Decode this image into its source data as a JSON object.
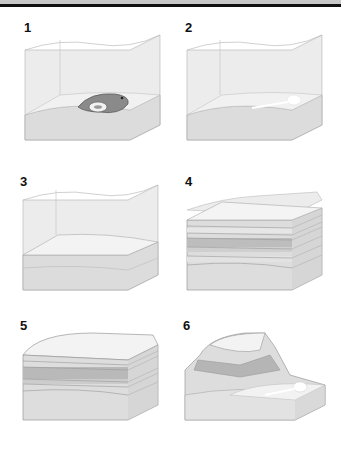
{
  "panels": [
    {
      "number": "1",
      "description": "Dead fish lies on sediment at the bottom of water"
    },
    {
      "number": "2",
      "description": "Soft tissue decays leaving skeleton on sea floor"
    },
    {
      "number": "3",
      "description": "Skeleton buried by a layer of sediment"
    },
    {
      "number": "4",
      "description": "Many sediment layers accumulate above the remains"
    },
    {
      "number": "5",
      "description": "Water gone; layered rock exposed"
    },
    {
      "number": "6",
      "description": "Erosion of rock layers exposes fossil"
    }
  ],
  "colors": {
    "water": "#e6e6e6",
    "sediment_light": "#efefef",
    "sediment_mid": "#cfcfcf",
    "sediment_dark": "#a9a9a9",
    "fish": "#8a8a8a",
    "outline": "#9a9a9a"
  }
}
